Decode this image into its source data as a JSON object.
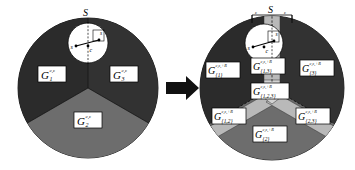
{
  "figure": {
    "title_symbol": "S",
    "arrow": "right-arrow",
    "background_color": "#ffffff"
  },
  "palette": {
    "dark_sector": "#2b2b2b",
    "mid_sector": "#6d6d6d",
    "light_region": "#b9b9b9",
    "lighter_region": "#d2d2d2",
    "white": "#ffffff",
    "outline": "#000000"
  },
  "left_panel": {
    "name": "original-partition",
    "top_label": "S",
    "inner_disk": {
      "point_left_label": "s",
      "point_right_label": "s",
      "center_label": "c",
      "epsilon_label": "ε"
    },
    "sectors": [
      {
        "id": "g1",
        "base": "G",
        "sub": "1",
        "sup": "c,ε",
        "color_key": "dark_sector"
      },
      {
        "id": "g3",
        "base": "G",
        "sub": "3",
        "sup": "c,ε",
        "color_key": "dark_sector"
      },
      {
        "id": "g2",
        "base": "G",
        "sub": "2",
        "sup": "c,ε",
        "color_key": "mid_sector"
      }
    ]
  },
  "right_panel": {
    "name": "refined-partition",
    "top_label": "S",
    "bracket_left_label": "ε",
    "bracket_right_label": "ε",
    "inner_disk": {
      "point_left_label": "s",
      "point_right_label": "s",
      "center_label": "c",
      "epsilon_label": "ε"
    },
    "regions": [
      {
        "id": "r1",
        "base": "G",
        "sub": "{1}",
        "sup": "c,ε,+R",
        "color_key": "dark_sector"
      },
      {
        "id": "r3",
        "base": "G",
        "sub": "{3}",
        "sup": "c,ε,+R",
        "color_key": "dark_sector"
      },
      {
        "id": "r13",
        "base": "G",
        "sub": "{1,3}",
        "sup": "c,ε,+R",
        "color_key": "light_region"
      },
      {
        "id": "r123",
        "base": "G",
        "sub": "{1,2,3}",
        "sup": "c,ε,+R",
        "color_key": "lighter_region"
      },
      {
        "id": "r12",
        "base": "G",
        "sub": "{1,2}",
        "sup": "c,ε,+R",
        "color_key": "light_region"
      },
      {
        "id": "r23",
        "base": "G",
        "sub": "{2,3}",
        "sup": "c,ε,+R",
        "color_key": "light_region"
      },
      {
        "id": "r2",
        "base": "G",
        "sub": "{2}",
        "sup": "c,ε,+R",
        "color_key": "mid_sector"
      }
    ]
  }
}
